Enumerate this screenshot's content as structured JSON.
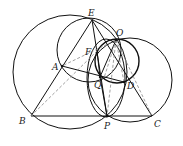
{
  "diagram": {
    "type": "geometry-figure",
    "points": {
      "E": {
        "label": "E",
        "x": 92,
        "y": 20
      },
      "O": {
        "label": "O",
        "x": 116,
        "y": 40
      },
      "F": {
        "label": "F",
        "x": 97,
        "y": 51
      },
      "A": {
        "label": "A",
        "x": 62,
        "y": 66
      },
      "Q": {
        "label": "Q",
        "x": 100,
        "y": 77
      },
      "D": {
        "label": "D",
        "x": 124,
        "y": 82
      },
      "B": {
        "label": "B",
        "x": 31,
        "y": 116
      },
      "P": {
        "label": "P",
        "x": 107,
        "y": 116
      },
      "C": {
        "label": "C",
        "x": 152,
        "y": 116
      }
    },
    "labels": [
      "E",
      "O",
      "F",
      "A",
      "Q",
      "D",
      "B",
      "P",
      "C"
    ],
    "solid_segments": [
      [
        "B",
        "E"
      ],
      [
        "E",
        "P"
      ],
      [
        "B",
        "C"
      ],
      [
        "A",
        "D"
      ],
      [
        "E",
        "C"
      ],
      [
        "O",
        "Q"
      ],
      [
        "Q",
        "P"
      ],
      [
        "O",
        "D"
      ]
    ],
    "dashed_segments": [
      [
        "B",
        "F"
      ],
      [
        "O",
        "A"
      ],
      [
        "O",
        "P"
      ],
      [
        "O",
        "C"
      ],
      [
        "O",
        "Q"
      ],
      [
        "F",
        "D"
      ]
    ],
    "circles": [
      {
        "name": "circumcircle-large",
        "cx": 70,
        "cy": 72,
        "r": 57
      },
      {
        "name": "circle-EA",
        "cx": 89,
        "cy": 50,
        "r": 32
      },
      {
        "name": "circle-right",
        "cx": 130,
        "cy": 80,
        "r": 42
      },
      {
        "name": "circle-small",
        "cx": 117,
        "cy": 61,
        "r": 22
      },
      {
        "name": "circle-OQP",
        "cx": 106,
        "cy": 78,
        "r": 19
      }
    ],
    "colors": {
      "stroke": "#111111",
      "dashed": "#888888",
      "label": "#222222"
    }
  }
}
